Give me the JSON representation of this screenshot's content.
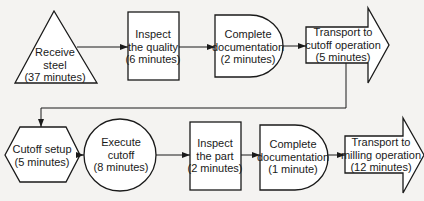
{
  "diagram": {
    "type": "process-flowchart",
    "colors": {
      "stroke": "#1a1a1a",
      "fill": "#ffffff",
      "background": "#f4f3f1"
    },
    "row1": [
      {
        "id": "receive",
        "shape": "triangle",
        "symbol": "storage",
        "lines": [
          "Receive",
          "steel",
          "(37 minutes)"
        ]
      },
      {
        "id": "inspect-quality",
        "shape": "rectangle",
        "symbol": "inspection",
        "lines": [
          "Inspect",
          "the quality",
          "(6 minutes)"
        ]
      },
      {
        "id": "doc1",
        "shape": "d-shape",
        "symbol": "delay",
        "lines": [
          "Complete",
          "documentation",
          "(2 minutes)"
        ]
      },
      {
        "id": "transport-cutoff",
        "shape": "block-arrow",
        "symbol": "transport",
        "lines": [
          "Transport to",
          "cutoff operation",
          "(5 minutes)"
        ]
      }
    ],
    "row2": [
      {
        "id": "cutoff-setup",
        "shape": "hexagon",
        "symbol": "setup",
        "lines": [
          "Cutoff setup",
          "(5 minutes)"
        ]
      },
      {
        "id": "execute-cutoff",
        "shape": "circle",
        "symbol": "operation",
        "lines": [
          "Execute",
          "cutoff",
          "(8 minutes)"
        ]
      },
      {
        "id": "inspect-part",
        "shape": "rectangle",
        "symbol": "inspection",
        "lines": [
          "Inspect",
          "the part",
          "(2 minutes)"
        ]
      },
      {
        "id": "doc2",
        "shape": "d-shape",
        "symbol": "delay",
        "lines": [
          "Complete",
          "documentation",
          "(1 minute)"
        ]
      },
      {
        "id": "transport-milling",
        "shape": "block-arrow",
        "symbol": "transport",
        "lines": [
          "Transport to",
          "milling operation",
          "(12 minutes)"
        ]
      }
    ]
  }
}
